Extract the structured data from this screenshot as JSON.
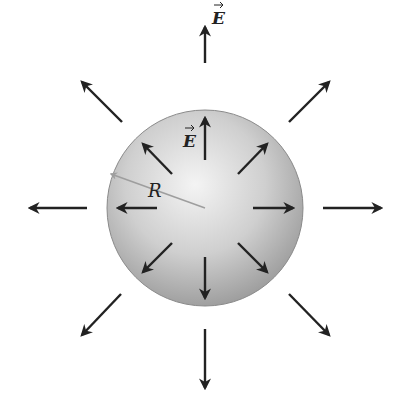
{
  "figure": {
    "sphere": {
      "cx": 205,
      "cy": 208,
      "r": 98,
      "fill_light": "#f2f2f2",
      "fill_dark": "#9a9a9a"
    },
    "radius_label": "R",
    "field_label_outer": "E",
    "field_label_inner": "E",
    "arrow_color": "#222222",
    "radius_color": "#9e9e9e",
    "inner_arrows": [
      {
        "x1": 205,
        "y1": 160,
        "x2": 205,
        "y2": 118
      },
      {
        "x1": 172,
        "y1": 174,
        "x2": 143,
        "y2": 144
      },
      {
        "x1": 238,
        "y1": 174,
        "x2": 267,
        "y2": 144
      },
      {
        "x1": 157,
        "y1": 208,
        "x2": 118,
        "y2": 208
      },
      {
        "x1": 253,
        "y1": 208,
        "x2": 293,
        "y2": 208
      },
      {
        "x1": 172,
        "y1": 243,
        "x2": 143,
        "y2": 272
      },
      {
        "x1": 238,
        "y1": 243,
        "x2": 267,
        "y2": 272
      },
      {
        "x1": 205,
        "y1": 257,
        "x2": 205,
        "y2": 298
      }
    ],
    "outer_arrows": [
      {
        "x1": 205,
        "y1": 63,
        "x2": 205,
        "y2": 27
      },
      {
        "x1": 122,
        "y1": 122,
        "x2": 82,
        "y2": 82
      },
      {
        "x1": 289,
        "y1": 122,
        "x2": 329,
        "y2": 82
      },
      {
        "x1": 87,
        "y1": 208,
        "x2": 30,
        "y2": 208
      },
      {
        "x1": 323,
        "y1": 208,
        "x2": 381,
        "y2": 208
      },
      {
        "x1": 121,
        "y1": 294,
        "x2": 82,
        "y2": 335
      },
      {
        "x1": 289,
        "y1": 294,
        "x2": 329,
        "y2": 335
      },
      {
        "x1": 205,
        "y1": 329,
        "x2": 205,
        "y2": 388
      }
    ]
  }
}
